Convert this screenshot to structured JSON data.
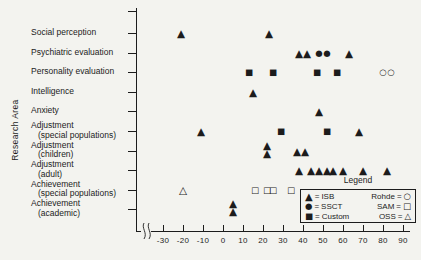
{
  "colors": {
    "background": "#f3f3ef",
    "ink": "#1c1c1c"
  },
  "markers": {
    "isb": "▲",
    "ssct": "●",
    "custom": "■",
    "rohde": "○",
    "sam": "□",
    "oss": "△"
  },
  "legend": {
    "title": "Legend",
    "eq": "=",
    "left": [
      {
        "key": "isb",
        "label": "ISB"
      },
      {
        "key": "ssct",
        "label": "SSCT"
      },
      {
        "key": "custom",
        "label": "Custom"
      }
    ],
    "right": [
      {
        "key": "rohde",
        "label": "Rohde"
      },
      {
        "key": "sam",
        "label": "SAM"
      },
      {
        "key": "oss",
        "label": "OSS"
      }
    ]
  },
  "y_labels": [
    {
      "lines": [
        "Social perception"
      ]
    },
    {
      "lines": [
        "Psychiatric evaluation"
      ]
    },
    {
      "lines": [
        "Personality evaluation"
      ]
    },
    {
      "lines": [
        "Intelligence"
      ]
    },
    {
      "lines": [
        "Anxiety"
      ]
    },
    {
      "lines": [
        "Adjustment",
        "(special populations)"
      ]
    },
    {
      "lines": [
        "Adjustment",
        "(children)"
      ]
    },
    {
      "lines": [
        "Adjustment",
        "(adult)"
      ]
    },
    {
      "lines": [
        "Achievement",
        "(special populations)"
      ]
    },
    {
      "lines": [
        "Achievement",
        "(academic)"
      ]
    }
  ],
  "chart_data": {
    "type": "scatter",
    "title": "",
    "xlabel": "",
    "ylabel": "Research Area",
    "xlim": [
      -35,
      93
    ],
    "axis_break_before_first_tick": true,
    "grid": false,
    "legend_position": "bottom-right",
    "x_ticks": [
      -30,
      -20,
      -10,
      0,
      10,
      20,
      30,
      40,
      50,
      60,
      70,
      80,
      90
    ],
    "x_tick_labels": [
      "-30",
      "-20",
      "-10",
      "0",
      "10",
      "20",
      "30",
      "40",
      "50",
      "60",
      "70",
      "80",
      "90"
    ],
    "categories": [
      "Social perception",
      "Psychiatric evaluation",
      "Personality evaluation",
      "Intelligence",
      "Anxiety",
      "Adjustment (special populations)",
      "Adjustment (children)",
      "Adjustment (adult)",
      "Achievement (special populations)",
      "Achievement (academic)"
    ],
    "series": [
      {
        "key": "isb",
        "name": "ISB",
        "marker": "filled-triangle",
        "points": [
          {
            "row": 0,
            "x": -21
          },
          {
            "row": 0,
            "x": 23
          },
          {
            "row": 1,
            "x": 38
          },
          {
            "row": 1,
            "x": 42
          },
          {
            "row": 1,
            "x": 63
          },
          {
            "row": 3,
            "x": 15
          },
          {
            "row": 4,
            "x": 48
          },
          {
            "row": 5,
            "x": -11
          },
          {
            "row": 5,
            "x": 68
          },
          {
            "row": 6,
            "x": 22,
            "dy": -6
          },
          {
            "row": 6,
            "x": 22,
            "dy": 2
          },
          {
            "row": 6,
            "x": 37
          },
          {
            "row": 6,
            "x": 41
          },
          {
            "row": 7,
            "x": 38
          },
          {
            "row": 7,
            "x": 44
          },
          {
            "row": 7,
            "x": 48
          },
          {
            "row": 7,
            "x": 52
          },
          {
            "row": 7,
            "x": 55
          },
          {
            "row": 7,
            "x": 60
          },
          {
            "row": 7,
            "x": 70
          },
          {
            "row": 7,
            "x": 82
          },
          {
            "row": 9,
            "x": 5,
            "dy": -6
          },
          {
            "row": 9,
            "x": 5,
            "dy": 2
          }
        ]
      },
      {
        "key": "ssct",
        "name": "SSCT",
        "marker": "filled-circle",
        "points": [
          {
            "row": 1,
            "x": 48
          },
          {
            "row": 1,
            "x": 52
          }
        ]
      },
      {
        "key": "custom",
        "name": "Custom",
        "marker": "filled-square",
        "points": [
          {
            "row": 2,
            "x": 13
          },
          {
            "row": 2,
            "x": 25
          },
          {
            "row": 2,
            "x": 47
          },
          {
            "row": 2,
            "x": 57
          },
          {
            "row": 5,
            "x": 29
          },
          {
            "row": 5,
            "x": 52
          }
        ]
      },
      {
        "key": "rohde",
        "name": "Rohde",
        "marker": "open-circle",
        "points": [
          {
            "row": 2,
            "x": 80
          },
          {
            "row": 2,
            "x": 84
          }
        ]
      },
      {
        "key": "sam",
        "name": "SAM",
        "marker": "open-square",
        "points": [
          {
            "row": 8,
            "x": 16
          },
          {
            "row": 8,
            "x": 22
          },
          {
            "row": 8,
            "x": 25
          },
          {
            "row": 8,
            "x": 34
          }
        ]
      },
      {
        "key": "oss",
        "name": "OSS",
        "marker": "open-triangle",
        "points": [
          {
            "row": 8,
            "x": -20
          }
        ]
      }
    ]
  }
}
